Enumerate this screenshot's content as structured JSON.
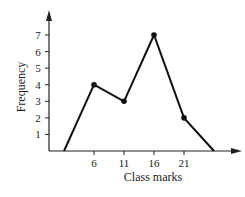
{
  "chart_data": {
    "type": "line",
    "title": "",
    "xlabel": "Class marks",
    "ylabel": "Frequency",
    "x": [
      1,
      6,
      11,
      16,
      21,
      26
    ],
    "values": [
      0,
      4,
      3,
      7,
      2,
      0
    ],
    "marked_points": [
      {
        "x": 6,
        "y": 4
      },
      {
        "x": 11,
        "y": 3
      },
      {
        "x": 16,
        "y": 7
      },
      {
        "x": 21,
        "y": 2
      }
    ],
    "x_ticks": [
      6,
      11,
      16,
      21
    ],
    "y_ticks": [
      1,
      2,
      3,
      4,
      5,
      6,
      7
    ],
    "ylim": [
      0,
      8
    ],
    "grid": false,
    "legend": null
  },
  "labels": {
    "xlabel": "Class marks",
    "ylabel": "Frequency",
    "xticks": [
      "6",
      "11",
      "16",
      "21"
    ],
    "yticks": [
      "1",
      "2",
      "3",
      "4",
      "5",
      "6",
      "7"
    ]
  }
}
